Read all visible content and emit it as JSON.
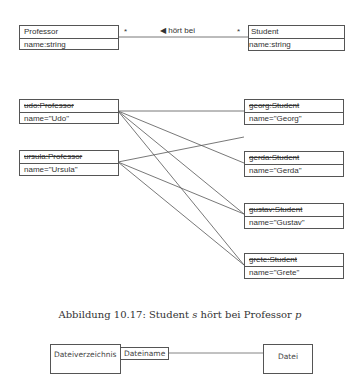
{
  "class_diagram": {
    "professor": {
      "name": "Professor",
      "attribute": "name:string"
    },
    "student": {
      "name": "Student",
      "attribute": "name:string"
    },
    "association": {
      "label": "◀ hört bei",
      "multiplicity_left": "*",
      "multiplicity_right": "*"
    }
  },
  "object_diagram": {
    "professors": [
      {
        "name": "udo:Professor",
        "attribute": "name=\"Udo\""
      },
      {
        "name": "ursula:Professor",
        "attribute": "name=\"Ursula\""
      }
    ],
    "students": [
      {
        "name": "georg:Student",
        "attribute": "name=\"Georg\""
      },
      {
        "name": "gerda:Student",
        "attribute": "name=\"Gerda\""
      },
      {
        "name": "gustav:Student",
        "attribute": "name=\"Gustav\""
      },
      {
        "name": "grete:Student",
        "attribute": "name=\"Grete\""
      }
    ],
    "links": [
      {
        "from": "udo",
        "to": "georg"
      },
      {
        "from": "udo",
        "to": "gerda"
      },
      {
        "from": "udo",
        "to": "gustav"
      },
      {
        "from": "udo",
        "to": "grete"
      },
      {
        "from": "ursula",
        "to": "georg"
      },
      {
        "from": "ursula",
        "to": "gustav"
      },
      {
        "from": "ursula",
        "to": "grete"
      }
    ]
  },
  "caption": {
    "prefix": "Abbildung 10.17: Student ",
    "var_s": "s",
    "middle": " hört bei Professor ",
    "var_p": "p"
  },
  "bottom_diagram": {
    "left_class": "Dateiverzeichnis",
    "qualifier": "Dateiname",
    "right_class": "Datei"
  }
}
